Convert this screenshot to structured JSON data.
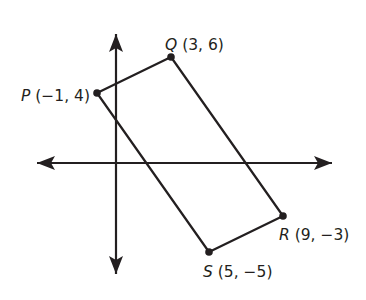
{
  "colors": {
    "stroke": "#231f20",
    "background": "#ffffff"
  },
  "axes": {
    "x_axis": {
      "y": 163,
      "x_start": 37,
      "x_end": 332,
      "arrows": "both"
    },
    "y_axis": {
      "x": 116,
      "y_start": 34,
      "y_end": 274,
      "arrows": "both"
    }
  },
  "points": [
    {
      "name": "P",
      "coords": "(−1, 4)",
      "x": -1,
      "y": 4,
      "px": 97,
      "py": 93
    },
    {
      "name": "Q",
      "coords": "(3, 6)",
      "x": 3,
      "y": 6,
      "px": 171,
      "py": 57
    },
    {
      "name": "R",
      "coords": "(9, −3)",
      "x": 9,
      "y": -3,
      "px": 283,
      "py": 216
    },
    {
      "name": "S",
      "coords": "(5, −5)",
      "x": 5,
      "y": -5,
      "px": 209,
      "py": 252
    }
  ],
  "labels": {
    "P": {
      "letter": "P",
      "coords": " (−1, 4)"
    },
    "Q": {
      "letter": "Q",
      "coords": " (3, 6)"
    },
    "R": {
      "letter": "R",
      "coords": " (9, −3)"
    },
    "S": {
      "letter": "S",
      "coords": " (5, −5)"
    }
  },
  "shape": {
    "type": "quadrilateral",
    "vertices": [
      "P",
      "Q",
      "R",
      "S"
    ]
  }
}
